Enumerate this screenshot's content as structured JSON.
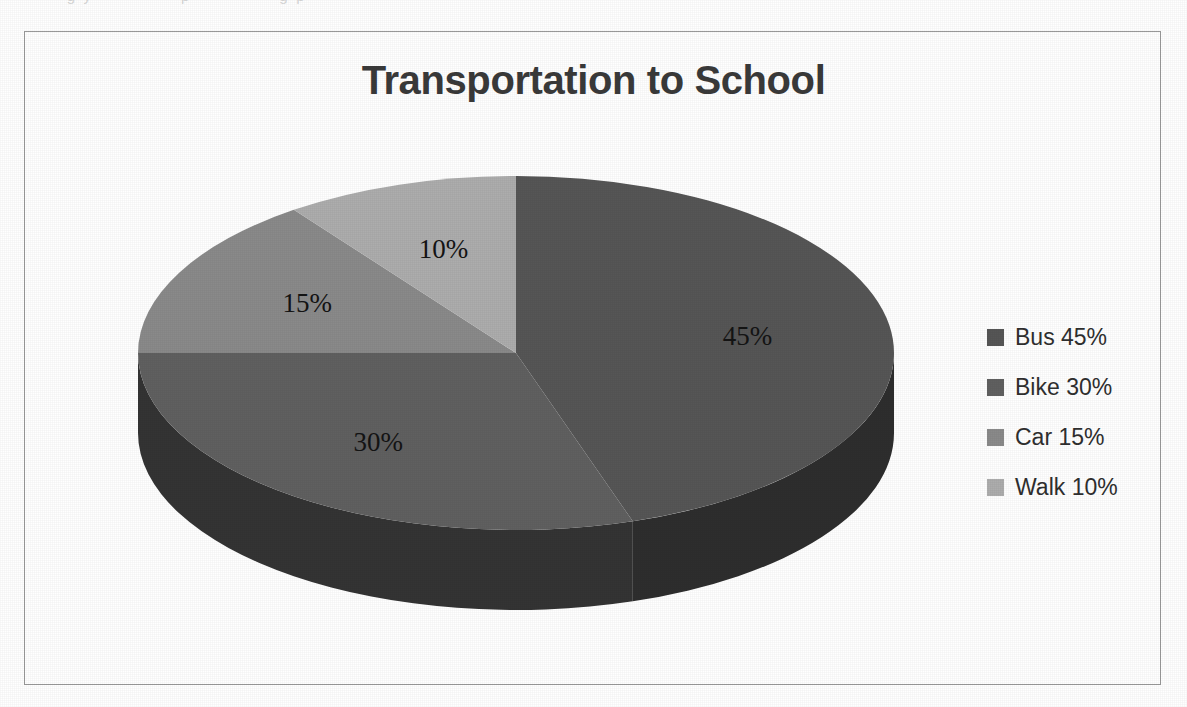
{
  "page": {
    "top_scan_text": "· · · g y · · · · · · p · · · · · · g p ·"
  },
  "chart_data": {
    "type": "pie",
    "title": "Transportation to School",
    "three_d": true,
    "start_angle_deg": 0,
    "direction": "clockwise",
    "categories": [
      "Bus",
      "Bike",
      "Car",
      "Walk"
    ],
    "values": [
      45,
      30,
      15,
      10
    ],
    "value_unit": "%",
    "data_labels": [
      "45%",
      "30%",
      "15%",
      "10%"
    ],
    "colors": [
      "#565656",
      "#606060",
      "#8a8a8a",
      "#adadad"
    ],
    "side_colors": [
      "#2e2e2e",
      "#343434",
      "#4e4e4e",
      "#636363"
    ],
    "legend_position": "right",
    "legend": [
      {
        "label": "Bus 45%",
        "swatch": "#565656"
      },
      {
        "label": "Bike 30%",
        "swatch": "#606060"
      },
      {
        "label": "Car 15%",
        "swatch": "#8a8a8a"
      },
      {
        "label": "Walk 10%",
        "swatch": "#adadad"
      }
    ],
    "labels": {
      "bus": "45%",
      "bike": "30%",
      "car": "15%",
      "walk": "10%"
    }
  }
}
